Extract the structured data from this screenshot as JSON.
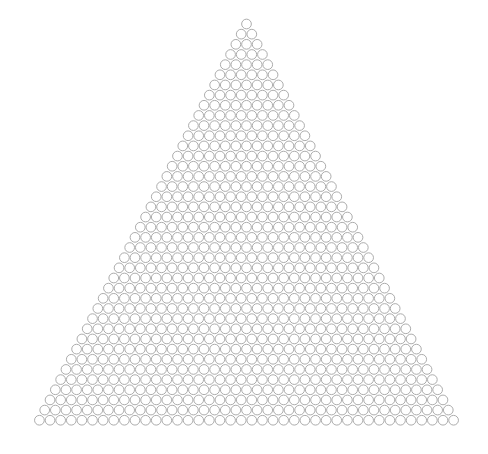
{
  "figure": {
    "kind": "triangular-circle-packing",
    "title": "",
    "background_color": "#ffffff",
    "width": 488,
    "height": 454
  },
  "diagram_data": {
    "type": "packing",
    "shape": "triangle",
    "orientation": "apex-up",
    "rows": 40,
    "row_counts_rule": "row n (1-indexed from apex) contains n circles",
    "bottom_row_count": 40,
    "top_row_count": 1,
    "total_circles": 820,
    "geometry": {
      "apex_center_x": 246.5,
      "apex_center_y": 24.0,
      "column_spacing": 10.62,
      "row_spacing": 10.16,
      "circle_radius": 4.85,
      "bottom_row_first_center_x": 39.4,
      "bottom_row_last_center_x": 453.6,
      "bottom_row_center_y": 420.2
    },
    "style": {
      "stroke_color": "#a3a3a3",
      "stroke_width": 0.9,
      "fill_color": "none"
    }
  }
}
